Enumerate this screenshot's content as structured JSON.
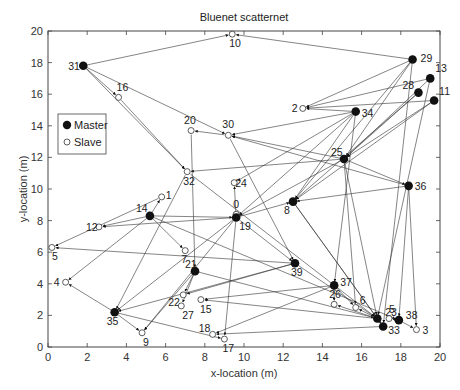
{
  "chart_data": {
    "type": "scatter",
    "title": "Bluenet scatternet",
    "xlabel": "x-location (m)",
    "ylabel": "y-location (m)",
    "xlim": [
      0,
      20
    ],
    "ylim": [
      0,
      20
    ],
    "xticks": [
      0,
      2,
      4,
      6,
      8,
      10,
      12,
      14,
      16,
      18,
      20
    ],
    "yticks": [
      0,
      2,
      4,
      6,
      8,
      10,
      12,
      14,
      16,
      18,
      20
    ],
    "grid": false,
    "legend": {
      "position": "upper-left",
      "entries": [
        {
          "label": "Master",
          "marker": "filled-circle"
        },
        {
          "label": "Slave",
          "marker": "open-circle"
        }
      ]
    },
    "nodes": [
      {
        "id": "0",
        "role": "Slave",
        "x": 9.6,
        "y": 8.4
      },
      {
        "id": "1",
        "role": "Slave",
        "x": 5.8,
        "y": 9.5
      },
      {
        "id": "2",
        "role": "Slave",
        "x": 13.0,
        "y": 15.1
      },
      {
        "id": "3",
        "role": "Slave",
        "x": 18.8,
        "y": 1.1
      },
      {
        "id": "4",
        "role": "Slave",
        "x": 0.9,
        "y": 4.1
      },
      {
        "id": "5",
        "role": "Slave",
        "x": 0.2,
        "y": 6.3
      },
      {
        "id": "6",
        "role": "Slave",
        "x": 15.7,
        "y": 2.5
      },
      {
        "id": "7",
        "role": "Slave",
        "x": 7.0,
        "y": 6.1
      },
      {
        "id": "8",
        "role": "Master",
        "x": 12.5,
        "y": 9.2
      },
      {
        "id": "9",
        "role": "Slave",
        "x": 4.8,
        "y": 0.9
      },
      {
        "id": "10",
        "role": "Slave",
        "x": 9.4,
        "y": 19.8
      },
      {
        "id": "11",
        "role": "Master",
        "x": 19.7,
        "y": 15.6
      },
      {
        "id": "12",
        "role": "Slave",
        "x": 2.6,
        "y": 7.6
      },
      {
        "id": "13",
        "role": "Master",
        "x": 19.5,
        "y": 17.0
      },
      {
        "id": "14",
        "role": "Master",
        "x": 5.2,
        "y": 8.3
      },
      {
        "id": "15",
        "role": "Slave",
        "x": 7.8,
        "y": 3.0
      },
      {
        "id": "16",
        "role": "Slave",
        "x": 3.6,
        "y": 15.8
      },
      {
        "id": "17",
        "role": "Slave",
        "x": 9.0,
        "y": 0.5
      },
      {
        "id": "18",
        "role": "Slave",
        "x": 8.4,
        "y": 0.8
      },
      {
        "id": "19",
        "role": "Master",
        "x": 9.6,
        "y": 8.2
      },
      {
        "id": "20",
        "role": "Slave",
        "x": 7.3,
        "y": 13.7
      },
      {
        "id": "21",
        "role": "Master",
        "x": 7.5,
        "y": 4.8
      },
      {
        "id": "22",
        "role": "Slave",
        "x": 6.9,
        "y": 3.3
      },
      {
        "id": "23",
        "role": "Master",
        "x": 16.8,
        "y": 1.8
      },
      {
        "id": "24",
        "role": "Slave",
        "x": 9.5,
        "y": 10.4
      },
      {
        "id": "25",
        "role": "Master",
        "x": 15.1,
        "y": 11.9
      },
      {
        "id": "26",
        "role": "Slave",
        "x": 14.6,
        "y": 2.7
      },
      {
        "id": "27",
        "role": "Slave",
        "x": 6.8,
        "y": 2.6
      },
      {
        "id": "28",
        "role": "Master",
        "x": 18.9,
        "y": 16.1
      },
      {
        "id": "29",
        "role": "Master",
        "x": 18.6,
        "y": 18.2
      },
      {
        "id": "30",
        "role": "Slave",
        "x": 9.2,
        "y": 13.4
      },
      {
        "id": "31",
        "role": "Master",
        "x": 1.8,
        "y": 17.8
      },
      {
        "id": "32",
        "role": "Slave",
        "x": 7.1,
        "y": 11.1
      },
      {
        "id": "33",
        "role": "Master",
        "x": 17.1,
        "y": 1.3
      },
      {
        "id": "34",
        "role": "Master",
        "x": 15.7,
        "y": 14.9
      },
      {
        "id": "35",
        "role": "Master",
        "x": 3.4,
        "y": 2.2
      },
      {
        "id": "36",
        "role": "Master",
        "x": 18.4,
        "y": 10.2
      },
      {
        "id": "37",
        "role": "Master",
        "x": 14.6,
        "y": 3.9
      },
      {
        "id": "38",
        "role": "Master",
        "x": 17.9,
        "y": 1.7
      },
      {
        "id": "39",
        "role": "Master",
        "x": 12.6,
        "y": 5.3
      },
      {
        "id": "5b",
        "role": "Slave",
        "x": 17.4,
        "y": 1.8
      }
    ],
    "links": [
      [
        "31",
        "10"
      ],
      [
        "31",
        "16"
      ],
      [
        "31",
        "32"
      ],
      [
        "31",
        "30"
      ],
      [
        "29",
        "10"
      ],
      [
        "29",
        "2"
      ],
      [
        "29",
        "8"
      ],
      [
        "29",
        "25"
      ],
      [
        "29",
        "33"
      ],
      [
        "13",
        "2"
      ],
      [
        "13",
        "23"
      ],
      [
        "13",
        "25"
      ],
      [
        "28",
        "25"
      ],
      [
        "28",
        "8"
      ],
      [
        "11",
        "2"
      ],
      [
        "11",
        "25"
      ],
      [
        "11",
        "8"
      ],
      [
        "34",
        "2"
      ],
      [
        "34",
        "30"
      ],
      [
        "34",
        "24"
      ],
      [
        "34",
        "19"
      ],
      [
        "34",
        "8"
      ],
      [
        "34",
        "37"
      ],
      [
        "25",
        "30"
      ],
      [
        "25",
        "32"
      ],
      [
        "25",
        "19"
      ],
      [
        "25",
        "36"
      ],
      [
        "25",
        "23"
      ],
      [
        "25",
        "6"
      ],
      [
        "36",
        "8"
      ],
      [
        "36",
        "38"
      ],
      [
        "36",
        "3"
      ],
      [
        "36",
        "30"
      ],
      [
        "16",
        "32"
      ],
      [
        "30",
        "20"
      ],
      [
        "30",
        "39"
      ],
      [
        "20",
        "21"
      ],
      [
        "32",
        "35"
      ],
      [
        "32",
        "23"
      ],
      [
        "14",
        "1"
      ],
      [
        "14",
        "12"
      ],
      [
        "14",
        "4"
      ],
      [
        "14",
        "7"
      ],
      [
        "14",
        "19"
      ],
      [
        "14",
        "38"
      ],
      [
        "19",
        "0"
      ],
      [
        "19",
        "24"
      ],
      [
        "19",
        "12"
      ],
      [
        "19",
        "17"
      ],
      [
        "19",
        "9"
      ],
      [
        "19",
        "8"
      ],
      [
        "19",
        "39"
      ],
      [
        "19",
        "35"
      ],
      [
        "8",
        "23"
      ],
      [
        "8",
        "33"
      ],
      [
        "21",
        "22"
      ],
      [
        "21",
        "27"
      ],
      [
        "21",
        "9"
      ],
      [
        "21",
        "23"
      ],
      [
        "39",
        "35"
      ],
      [
        "39",
        "5"
      ],
      [
        "39",
        "22"
      ],
      [
        "37",
        "15"
      ],
      [
        "37",
        "26"
      ],
      [
        "37",
        "18"
      ],
      [
        "37",
        "6"
      ],
      [
        "35",
        "4"
      ],
      [
        "35",
        "9"
      ],
      [
        "35",
        "17"
      ],
      [
        "23",
        "6"
      ],
      [
        "23",
        "15"
      ],
      [
        "23",
        "26"
      ],
      [
        "33",
        "18"
      ],
      [
        "38",
        "3"
      ],
      [
        "38",
        "5b"
      ],
      [
        "39",
        "23"
      ],
      [
        "1",
        "5"
      ]
    ]
  },
  "plot_area": {
    "left": 48,
    "top": 31,
    "right": 440,
    "bottom": 347
  }
}
